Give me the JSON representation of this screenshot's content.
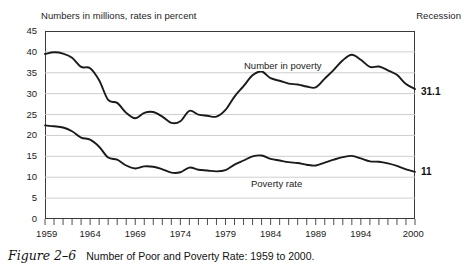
{
  "figure": {
    "number": "Figure 2–6",
    "caption": "Number of Poor and Poverty Rate: 1959 to 2000."
  },
  "chart_data": {
    "type": "line",
    "title": "Number of Poor and Poverty Rate: 1959 to 2000.",
    "subtitle": "Numbers in millions, rates in percent",
    "xlabel": "",
    "ylabel": "",
    "xlim": [
      1959,
      2000
    ],
    "ylim": [
      0,
      45
    ],
    "ytick_step": 5,
    "ytick_labels": [
      "0",
      "5",
      "10",
      "15",
      "20",
      "25",
      "30",
      "35",
      "40",
      "45"
    ],
    "xtick_labels": [
      "1959",
      "1964",
      "1969",
      "1974",
      "1979",
      "1984",
      "1989",
      "1994",
      "2000"
    ],
    "xtick_values": [
      1959,
      1964,
      1969,
      1974,
      1979,
      1984,
      1989,
      1994,
      2000
    ],
    "xtick_minor_every": 1,
    "grid": true,
    "grid_axis": "y",
    "grid_color": "#c8c8c8",
    "line_color": "#1a1a1a",
    "legend": "inline-labels",
    "legend_position": "inline",
    "annotations": [
      {
        "text": "Recession",
        "position": "top-right-outside"
      },
      {
        "text": "Numbers in millions, rates in percent",
        "position": "top-left-outside"
      },
      {
        "text": "Number in poverty",
        "position": "inline-upper-series"
      },
      {
        "text": "Poverty rate",
        "position": "inline-lower-series"
      }
    ],
    "end_labels": [
      {
        "series": "Number in poverty",
        "value": "31.1",
        "year": 2000
      },
      {
        "series": "Poverty rate",
        "value": "11",
        "year": 2000
      }
    ],
    "x": [
      1959,
      1960,
      1961,
      1962,
      1963,
      1964,
      1965,
      1966,
      1967,
      1968,
      1969,
      1970,
      1971,
      1972,
      1973,
      1974,
      1975,
      1976,
      1977,
      1978,
      1979,
      1980,
      1981,
      1982,
      1983,
      1984,
      1985,
      1986,
      1987,
      1988,
      1989,
      1990,
      1991,
      1992,
      1993,
      1994,
      1995,
      1996,
      1997,
      1998,
      1999,
      2000
    ],
    "series": [
      {
        "name": "Number in poverty",
        "unit": "millions",
        "color": "#1a1a1a",
        "values": [
          39.5,
          39.9,
          39.6,
          38.6,
          36.4,
          36.1,
          33.2,
          28.5,
          27.8,
          25.4,
          24.1,
          25.4,
          25.6,
          24.5,
          23.0,
          23.4,
          25.9,
          25.0,
          24.7,
          24.5,
          26.1,
          29.3,
          31.8,
          34.4,
          35.3,
          33.7,
          33.1,
          32.4,
          32.2,
          31.7,
          31.5,
          33.6,
          35.7,
          38.0,
          39.3,
          38.1,
          36.4,
          36.5,
          35.6,
          34.5,
          32.3,
          31.1
        ]
      },
      {
        "name": "Poverty rate",
        "unit": "percent",
        "color": "#1a1a1a",
        "values": [
          22.4,
          22.2,
          21.9,
          21.0,
          19.5,
          19.0,
          17.3,
          14.7,
          14.2,
          12.8,
          12.1,
          12.6,
          12.5,
          11.9,
          11.1,
          11.2,
          12.3,
          11.8,
          11.6,
          11.4,
          11.7,
          13.0,
          14.0,
          15.0,
          15.2,
          14.4,
          14.0,
          13.6,
          13.4,
          13.0,
          12.8,
          13.5,
          14.2,
          14.8,
          15.1,
          14.5,
          13.8,
          13.7,
          13.3,
          12.7,
          11.9,
          11.3
        ]
      }
    ]
  }
}
